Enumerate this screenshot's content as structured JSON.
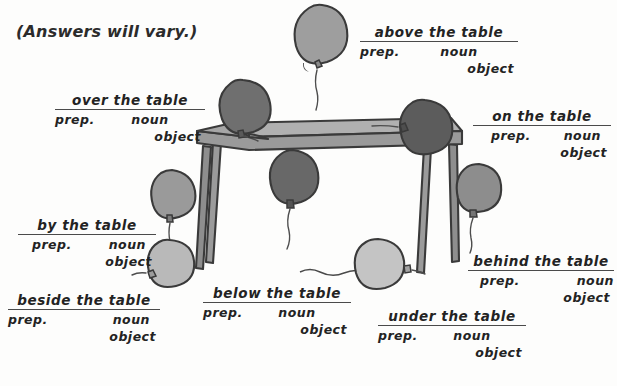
{
  "worksheet": {
    "heading": "(Answers will vary.)",
    "ink_color": "#232323",
    "rule_color": "#4a4a4a",
    "background_color": "#fdfdfc"
  },
  "labels": [
    {
      "id": "over-the-table",
      "phrase": "over  the  table",
      "prep": "prep.",
      "noun": "noun",
      "object": "object"
    },
    {
      "id": "above-the-table",
      "phrase": "above  the  table",
      "prep": "prep.",
      "noun": "noun",
      "object": "object"
    },
    {
      "id": "on-the-table",
      "phrase": "on  the  table",
      "prep": "prep.",
      "noun": "noun",
      "object": "object"
    },
    {
      "id": "by-the-table",
      "phrase": "by  the  table",
      "prep": "prep.",
      "noun": "noun",
      "object": "object"
    },
    {
      "id": "beside-the-table",
      "phrase": "beside  the  table",
      "prep": "prep.",
      "noun": "noun",
      "object": "object"
    },
    {
      "id": "below-the-table",
      "phrase": "below  the  table",
      "prep": "prep.",
      "noun": "noun",
      "object": "object"
    },
    {
      "id": "under-the-table",
      "phrase": "under  the  table",
      "prep": "prep.",
      "noun": "noun",
      "object": "object"
    },
    {
      "id": "behind-the-table",
      "phrase": "behind  the  table",
      "prep": "prep.",
      "noun": "noun",
      "object": "object"
    }
  ],
  "scene": {
    "table": {
      "top_fill": "#a9a9a9",
      "edge_fill": "#8f8f8f",
      "leg_fill": "#9b9b9b",
      "outline": "#3a3a3a"
    },
    "balloons": [
      {
        "id": "balloon-above",
        "shade": "#9e9e9e",
        "relation": "above the table"
      },
      {
        "id": "balloon-over-left",
        "shade": "#6f6f6f",
        "relation": "over the table"
      },
      {
        "id": "balloon-on",
        "shade": "#5c5c5c",
        "relation": "on the table"
      },
      {
        "id": "balloon-below",
        "shade": "#686868",
        "relation": "below the table"
      },
      {
        "id": "balloon-by",
        "shade": "#9a9a9a",
        "relation": "by the table"
      },
      {
        "id": "balloon-beside",
        "shade": "#b9b9b9",
        "relation": "beside the table"
      },
      {
        "id": "balloon-under",
        "shade": "#c4c4c4",
        "relation": "under the table"
      },
      {
        "id": "balloon-behind",
        "shade": "#8d8d8d",
        "relation": "behind the table"
      }
    ]
  }
}
